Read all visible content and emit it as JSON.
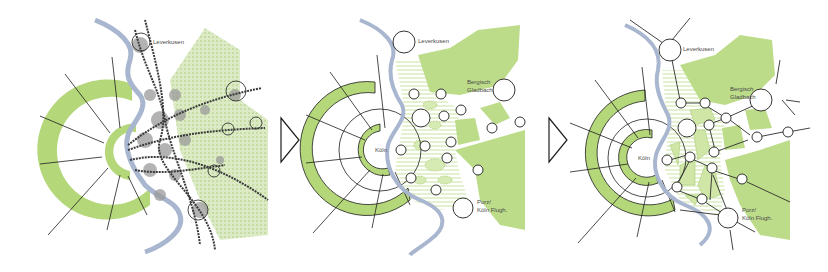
{
  "colors": {
    "green_ring": "#b4d77a",
    "green_area": "#bcdc8a",
    "green_hatch": "#c9e39e",
    "river": "#a9b6cf",
    "gray_blob": "#9a9a9a",
    "line": "#1e1e1e",
    "circle_fill": "#ffffff",
    "rail": "#3a3a3a"
  },
  "panels": [
    {
      "id": "panel-1-existing",
      "labels": {
        "leverkusen": "Leverkusen"
      }
    },
    {
      "id": "panel-2-green-structure",
      "labels": {
        "leverkusen": "Leverkusen",
        "bergisch_gladbach_1": "Bergisch",
        "bergisch_gladbach_2": "Gladbach",
        "koln": "Köln",
        "porz_1": "Porz/",
        "porz_2": "Köln Flugh."
      }
    },
    {
      "id": "panel-3-network",
      "labels": {
        "leverkusen": "Leverkusen",
        "bergisch_gladbach_1": "Bergisch",
        "bergisch_gladbach_2": "Gladbach",
        "koln": "Köln",
        "porz_1": "Porz/",
        "porz_2": "Köln Flugh."
      }
    }
  ],
  "arrows": [
    {
      "icon": "triangle-right-arrow"
    },
    {
      "icon": "triangle-right-arrow"
    }
  ]
}
